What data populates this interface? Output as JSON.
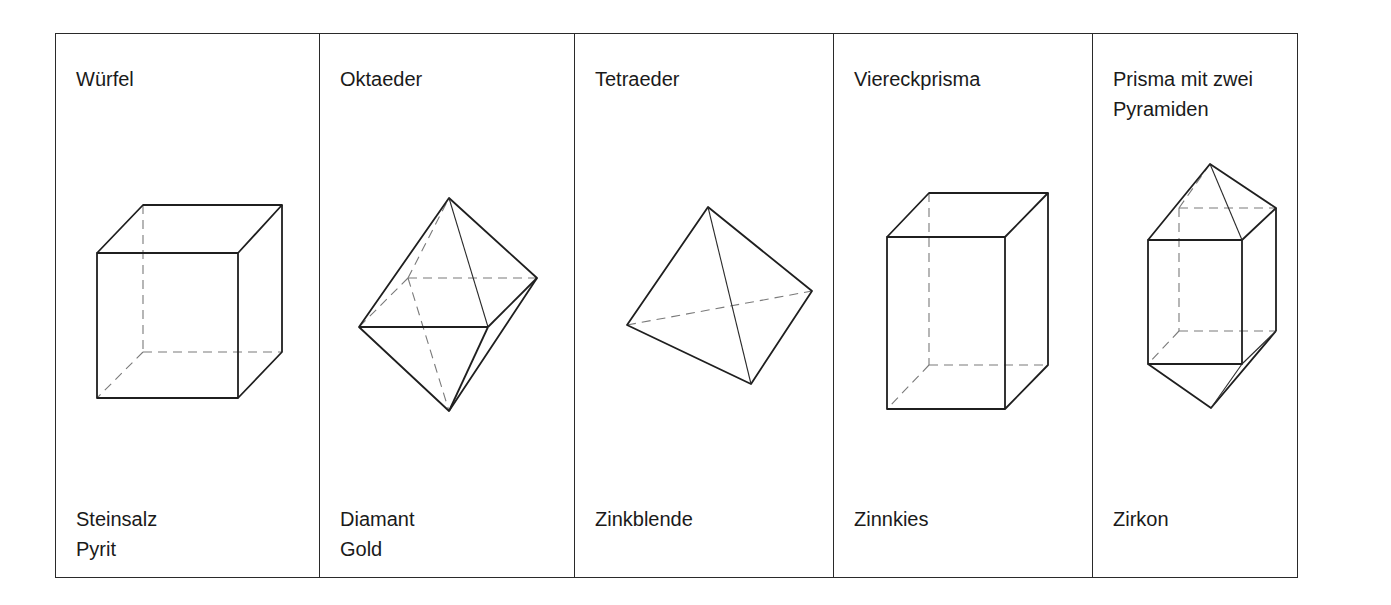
{
  "figure": {
    "columns": [
      {
        "id": "cube",
        "title": "Würfel",
        "shape_icon": "cube-icon",
        "minerals": [
          "Steinsalz",
          "Pyrit"
        ]
      },
      {
        "id": "octahedron",
        "title": "Oktaeder",
        "shape_icon": "octahedron-icon",
        "minerals": [
          "Diamant",
          "Gold"
        ]
      },
      {
        "id": "tetrahedron",
        "title": "Tetraeder",
        "shape_icon": "tetrahedron-icon",
        "minerals": [
          "Zinkblende"
        ]
      },
      {
        "id": "square-prism",
        "title": "Viereckprisma",
        "shape_icon": "square-prism-icon",
        "minerals": [
          "Zinnkies"
        ]
      },
      {
        "id": "prism-two-pyramids",
        "title": "Prisma mit zwei\nPyramiden",
        "shape_icon": "bipyramidal-prism-icon",
        "minerals": [
          "Zirkon"
        ]
      }
    ],
    "colors": {
      "line": "#1f1f1f",
      "hidden_edge": "#7a7a7a",
      "background": "#ffffff"
    }
  }
}
